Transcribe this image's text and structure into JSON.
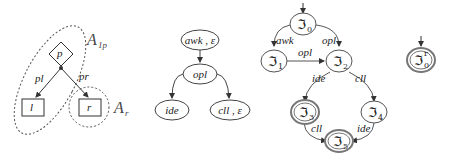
{
  "left_graph": {
    "nodes": {
      "p": "p",
      "l": "l",
      "r": "r"
    },
    "edges": {
      "pl": "pl",
      "pr": "pr"
    },
    "groups": {
      "a1p": "A",
      "a1p_sub": "1p",
      "ar": "A",
      "ar_sub": "r"
    }
  },
  "middle_tree": {
    "root": "awk , ε",
    "mid": "opl",
    "left": "ide",
    "right": "cll , ε"
  },
  "automaton": {
    "states": {
      "s0": {
        "sym": "ℑ",
        "sub": "0"
      },
      "s1": {
        "sym": "ℑ",
        "sub": "1"
      },
      "s2": {
        "sym": "ℑ",
        "sub": "2"
      },
      "s3": {
        "sym": "ℑ",
        "sub": "3"
      },
      "s4": {
        "sym": "ℑ",
        "sub": "4"
      },
      "s5": {
        "sym": "ℑ",
        "sub": "5"
      }
    },
    "edges": {
      "e01": "awk",
      "e02": "opl",
      "e12": "opl",
      "e23": "ide",
      "e24": "cll",
      "e35": "cll",
      "e45": "ide"
    }
  },
  "standalone_state": {
    "sym": "ℑ",
    "sub": "0",
    "sup": "r"
  }
}
